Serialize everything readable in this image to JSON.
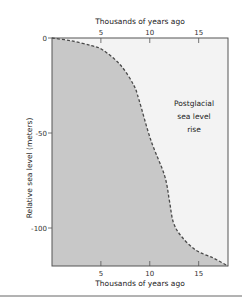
{
  "chart_data": {
    "type": "area",
    "title": "",
    "xlabel_top": "Thousands of years ago",
    "xlabel": "Thousands of years ago",
    "ylabel": "Relative sea level (meters)",
    "xlim": [
      0,
      18
    ],
    "ylim": [
      -120,
      0
    ],
    "x_ticks": [
      5,
      10,
      15
    ],
    "y_ticks": [
      0,
      -50,
      -100
    ],
    "grid": false,
    "legend": null,
    "annotation": [
      "Postglacial",
      "sea level",
      "rise"
    ],
    "series": [
      {
        "name": "Relative sea level",
        "style": "dashed",
        "x": [
          0,
          2,
          4,
          5.2,
          7.0,
          8.35,
          8.9,
          10.1,
          11.5,
          12.0,
          12.4,
          13.2,
          14.7,
          16.5,
          18
        ],
        "y": [
          0,
          -1.5,
          -4,
          -6.3,
          -14.2,
          -24.7,
          -32.6,
          -53.7,
          -72.1,
          -85.3,
          -96.8,
          -104.2,
          -111.6,
          -115.8,
          -120
        ]
      }
    ],
    "colors": {
      "fill_below": "#c8c8c8",
      "fill_above": "#f3f3f3",
      "curve": "#4a4a4a",
      "frame": "#555555"
    }
  }
}
